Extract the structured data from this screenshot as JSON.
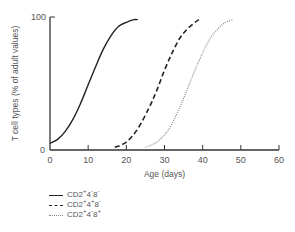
{
  "chart_data": {
    "type": "line",
    "title": "",
    "xlabel": "Age (days)",
    "ylabel": "T cell types (% of adult values)",
    "xlim": [
      0,
      60
    ],
    "ylim": [
      0,
      100
    ],
    "x_ticks": [
      "0",
      "10",
      "20",
      "30",
      "40",
      "50",
      "60"
    ],
    "y_ticks": [
      "0",
      "100"
    ],
    "grid": false,
    "legend_position": "below-left",
    "series": [
      {
        "name": "CD2+4-8-",
        "style": "solid",
        "x": [
          0,
          2,
          4,
          6,
          8,
          10,
          12,
          14,
          16,
          18,
          20,
          22,
          23
        ],
        "y": [
          5,
          8,
          14,
          23,
          35,
          49,
          63,
          76,
          86,
          93,
          96,
          98,
          98
        ]
      },
      {
        "name": "CD2+4+8-",
        "style": "dashed",
        "x": [
          17,
          20,
          23,
          26,
          28,
          30,
          32,
          34,
          36,
          38,
          39
        ],
        "y": [
          2,
          6,
          16,
          32,
          45,
          60,
          73,
          84,
          91,
          96,
          98
        ]
      },
      {
        "name": "CD2+4-8+",
        "style": "dotted",
        "x": [
          25,
          28,
          31,
          34,
          36,
          38,
          40,
          42,
          44,
          46,
          48
        ],
        "y": [
          2,
          6,
          15,
          32,
          46,
          60,
          73,
          84,
          91,
          96,
          98
        ]
      }
    ]
  },
  "legend": [
    {
      "base": "CD2",
      "s1": "+",
      "mid1": "4",
      "s2": "-",
      "mid2": "8",
      "s3": "-"
    },
    {
      "base": "CD2",
      "s1": "+",
      "mid1": "4",
      "s2": "+",
      "mid2": "8",
      "s3": "-"
    },
    {
      "base": "CD2",
      "s1": "+",
      "mid1": "4",
      "s2": "-",
      "mid2": "8",
      "s3": "+"
    }
  ],
  "axis": {
    "x_label": "Age (days)",
    "y_label": "T cell types (% of adult values)",
    "y_top": "100",
    "y_zero": "0"
  }
}
